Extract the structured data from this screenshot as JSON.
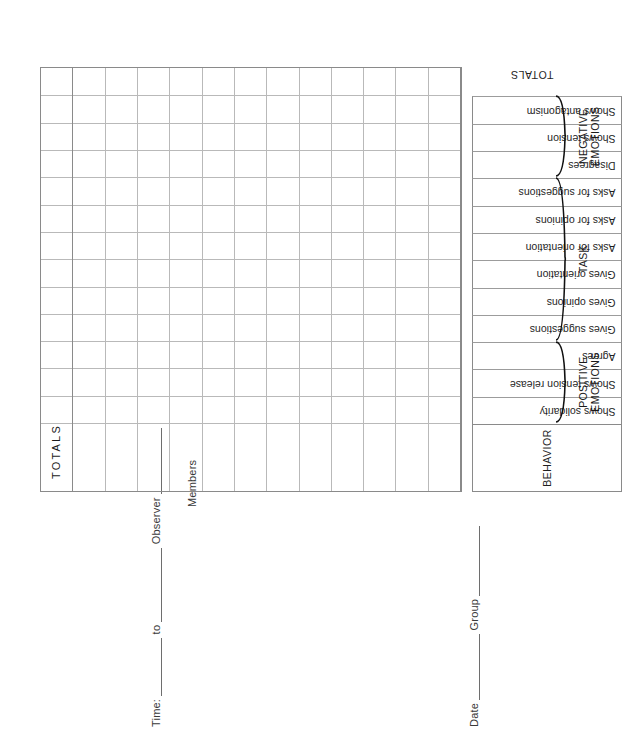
{
  "form": {
    "title": "Interaction Process Analysis Observation Form",
    "header": {
      "date_label": "Date",
      "group_label": "Group",
      "time_label": "Time:",
      "to_label": "to",
      "observer_label": "Observer",
      "members_label": "Members"
    },
    "behavior_header": "BEHAVIOR",
    "totals_column_label": "TOTALS",
    "totals_row_label": "TOTALS",
    "categories": [
      {
        "name": "POSITIVE\nEMOTIONS",
        "behaviors": [
          "Shows solidarity",
          "Shows tension release",
          "Agrees"
        ]
      },
      {
        "name": "TASK",
        "behaviors": [
          "Gives suggestions",
          "Gives opinions",
          "Gives orientation",
          "Asks for orientation",
          "Asks for opinions",
          "Asks for suggestions"
        ]
      },
      {
        "name": "NEGATIVE\nEMOTIONS",
        "behaviors": [
          "Disagrees",
          "Shows tension",
          "Shows antagonism"
        ]
      }
    ],
    "grid": {
      "member_row_count": 12,
      "behavior_column_count": 12,
      "totals_column_count": 1
    },
    "colors": {
      "ink": "#1f1f1f",
      "rule": "#8a8a8a",
      "grid_line": "#b9b9b9",
      "paper": "#ffffff"
    }
  }
}
